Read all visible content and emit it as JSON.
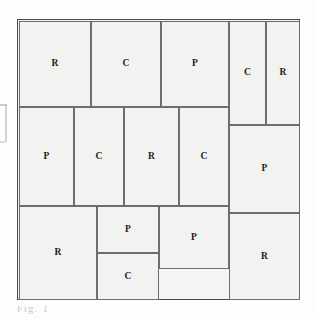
{
  "figure": {
    "caption_fragment": "Fig.  1",
    "frame": {
      "x": 17,
      "y": 19,
      "width": 283,
      "height": 281,
      "border_color": "#4a4a4a",
      "fill_color": "#f4f4f2"
    },
    "style": {
      "cell_fill": "#f2f2f0",
      "cell_border": "#6d6d6d",
      "label_color": "#1b1b1b",
      "page_background": "#fdfdfc"
    },
    "legend_keys": [
      "R",
      "C",
      "P"
    ],
    "cells": [
      {
        "id": "cell-1",
        "label": "R",
        "row": "top",
        "x": 1,
        "y": 1,
        "w": 72,
        "h": 86
      },
      {
        "id": "cell-2",
        "label": "C",
        "row": "top",
        "x": 73,
        "y": 1,
        "w": 70,
        "h": 86
      },
      {
        "id": "cell-3",
        "label": "P",
        "row": "top",
        "x": 143,
        "y": 1,
        "w": 68,
        "h": 86
      },
      {
        "id": "cell-4",
        "label": "C",
        "row": "top",
        "x": 211,
        "y": 1,
        "w": 37,
        "h": 104
      },
      {
        "id": "cell-5",
        "label": "R",
        "row": "top",
        "x": 248,
        "y": 1,
        "w": 34,
        "h": 104
      },
      {
        "id": "cell-6",
        "label": "P",
        "row": "middle",
        "x": 1,
        "y": 87,
        "w": 55,
        "h": 99
      },
      {
        "id": "cell-7",
        "label": "C",
        "row": "middle",
        "x": 56,
        "y": 87,
        "w": 50,
        "h": 99
      },
      {
        "id": "cell-8",
        "label": "R",
        "row": "middle",
        "x": 106,
        "y": 87,
        "w": 55,
        "h": 99
      },
      {
        "id": "cell-9",
        "label": "C",
        "row": "middle",
        "x": 161,
        "y": 87,
        "w": 50,
        "h": 99
      },
      {
        "id": "cell-10",
        "label": "P",
        "row": "middle",
        "x": 211,
        "y": 105,
        "w": 71,
        "h": 88
      },
      {
        "id": "cell-11",
        "label": "R",
        "row": "bottom",
        "x": 1,
        "y": 186,
        "w": 78,
        "h": 94
      },
      {
        "id": "cell-12",
        "label": "P",
        "row": "bottom",
        "x": 79,
        "y": 186,
        "w": 62,
        "h": 47
      },
      {
        "id": "cell-13",
        "label": "C",
        "row": "bottom",
        "x": 79,
        "y": 233,
        "w": 62,
        "h": 47
      },
      {
        "id": "cell-14",
        "label": "P",
        "row": "bottom",
        "x": 141,
        "y": 186,
        "w": 70,
        "h": 63
      },
      {
        "id": "cell-15",
        "label": "R",
        "row": "bottom",
        "x": 211,
        "y": 193,
        "w": 71,
        "h": 87
      }
    ]
  }
}
